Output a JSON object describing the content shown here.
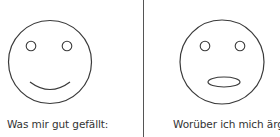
{
  "colors": {
    "stroke": "#3a3a3a",
    "divider": "#555555",
    "text": "#333333",
    "background": "#ffffff"
  },
  "panels": [
    {
      "face": "happy-face",
      "mouth": "smile",
      "label": "Was mir gut gefällt:"
    },
    {
      "face": "neutral-open-mouth-face",
      "mouth": "oval",
      "label": "Worüber ich mich ärgere:"
    }
  ]
}
